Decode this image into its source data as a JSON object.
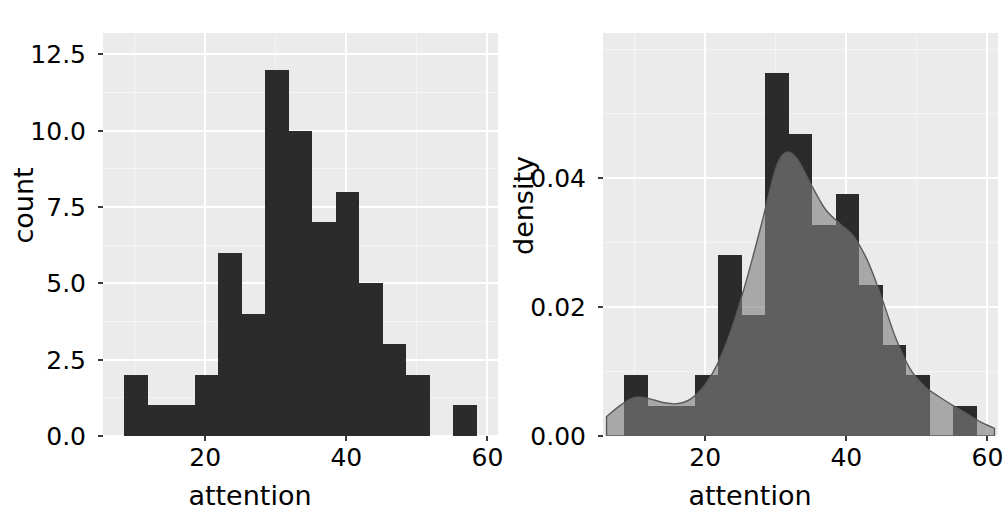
{
  "figure": {
    "background": "#ffffff",
    "panel_background": "#ebebeb",
    "grid_color": "#ffffff",
    "bar_color": "#2b2b2b",
    "density_fill": "#b8b8b8",
    "density_overlap": "#808080",
    "density_line": "#5a5a5a",
    "n_panels": 2
  },
  "chart_data": [
    {
      "type": "bar",
      "id": "count-histogram",
      "title": "",
      "xlabel": "attention",
      "ylabel": "count",
      "xlim": [
        5.5,
        61.5
      ],
      "ylim": [
        0,
        13.2
      ],
      "xticks": [
        20,
        40,
        60
      ],
      "xticklabels": [
        "20",
        "40",
        "60"
      ],
      "yticks": [
        0.0,
        2.5,
        5.0,
        7.5,
        10.0,
        12.5
      ],
      "yticklabels": [
        "0.0",
        "2.5",
        "5.0",
        "7.5",
        "10.0",
        "12.5"
      ],
      "grid": true,
      "legend": "none",
      "binwidth": 3.3333,
      "bin_edges": [
        8.5,
        11.83,
        15.17,
        18.5,
        21.83,
        25.17,
        28.5,
        31.83,
        35.17,
        38.5,
        41.83,
        45.17,
        48.5,
        51.83,
        55.17,
        58.5
      ],
      "bin_centers": [
        10.17,
        13.5,
        16.83,
        20.17,
        23.5,
        26.83,
        30.17,
        33.5,
        36.83,
        40.17,
        43.5,
        46.83,
        50.17,
        53.5,
        56.83
      ],
      "values": [
        2,
        1,
        1,
        2,
        6,
        4,
        12,
        10,
        7,
        8,
        5,
        3,
        2,
        0,
        1
      ],
      "total_count": 64
    },
    {
      "type": "area",
      "id": "density-histogram",
      "title": "",
      "xlabel": "attention",
      "ylabel": "density",
      "xlim": [
        5.5,
        61.5
      ],
      "ylim": [
        0,
        0.0625
      ],
      "xticks": [
        20,
        40,
        60
      ],
      "xticklabels": [
        "20",
        "40",
        "60"
      ],
      "yticks": [
        0.0,
        0.02,
        0.04
      ],
      "yticklabels": [
        "0.00",
        "0.02",
        "0.04"
      ],
      "grid": true,
      "legend": "none",
      "binwidth": 3.3333,
      "bin_edges": [
        8.5,
        11.83,
        15.17,
        18.5,
        21.83,
        25.17,
        28.5,
        31.83,
        35.17,
        38.5,
        41.83,
        45.17,
        48.5,
        51.83,
        55.17,
        58.5
      ],
      "bin_centers": [
        10.17,
        13.5,
        16.83,
        20.17,
        23.5,
        26.83,
        30.17,
        33.5,
        36.83,
        40.17,
        43.5,
        46.83,
        50.17,
        53.5,
        56.83
      ],
      "values": [
        0.0094,
        0.0047,
        0.0047,
        0.0094,
        0.0281,
        0.0188,
        0.0563,
        0.0469,
        0.0328,
        0.0375,
        0.0234,
        0.0141,
        0.0094,
        0.0,
        0.0047
      ],
      "series": [
        {
          "name": "histogram-density",
          "kind": "bar",
          "values": [
            0.0094,
            0.0047,
            0.0047,
            0.0094,
            0.0281,
            0.0188,
            0.0563,
            0.0469,
            0.0328,
            0.0375,
            0.0234,
            0.0141,
            0.0094,
            0.0,
            0.0047
          ]
        },
        {
          "name": "kernel-density-estimate",
          "kind": "area",
          "x": [
            6.0,
            8.0,
            10.0,
            12.0,
            14.0,
            16.0,
            18.0,
            20.0,
            22.0,
            24.0,
            26.0,
            28.0,
            30.0,
            31.5,
            33.0,
            35.0,
            37.0,
            39.0,
            41.0,
            43.0,
            45.0,
            47.0,
            49.0,
            51.0,
            53.0,
            55.0,
            57.0,
            59.0,
            61.0
          ],
          "values": [
            0.003,
            0.0048,
            0.006,
            0.0058,
            0.0052,
            0.005,
            0.0058,
            0.008,
            0.0118,
            0.0175,
            0.0248,
            0.033,
            0.0415,
            0.044,
            0.043,
            0.039,
            0.0352,
            0.033,
            0.031,
            0.0272,
            0.0215,
            0.0152,
            0.0105,
            0.0078,
            0.0062,
            0.0048,
            0.0035,
            0.0022,
            0.0012
          ]
        }
      ]
    }
  ]
}
